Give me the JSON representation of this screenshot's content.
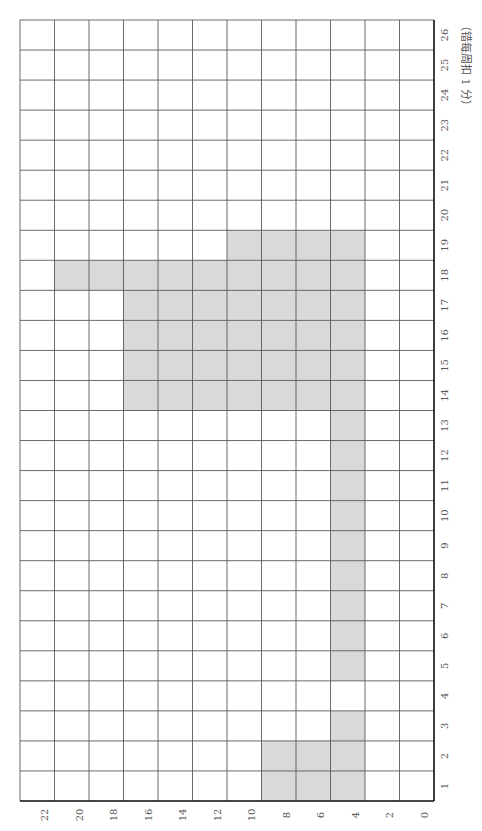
{
  "chart_data": {
    "type": "bar",
    "orientation": "rotated-90",
    "note": "（错每周扣 1 分）",
    "categories": [
      "1",
      "2",
      "3",
      "4",
      "5",
      "6",
      "7",
      "8",
      "9",
      "10",
      "11",
      "12",
      "13",
      "14",
      "15",
      "16",
      "17",
      "18",
      "19",
      "20",
      "21",
      "22",
      "23",
      "24",
      "25",
      "26"
    ],
    "ranges": [
      [
        4,
        10
      ],
      [
        4,
        10
      ],
      [
        4,
        6
      ],
      null,
      [
        4,
        6
      ],
      [
        4,
        6
      ],
      [
        4,
        6
      ],
      [
        4,
        6
      ],
      [
        4,
        6
      ],
      [
        4,
        6
      ],
      [
        4,
        6
      ],
      [
        4,
        6
      ],
      [
        4,
        6
      ],
      [
        4,
        18
      ],
      [
        4,
        18
      ],
      [
        4,
        18
      ],
      [
        4,
        18
      ],
      [
        4,
        22
      ],
      [
        4,
        12
      ],
      null,
      null,
      null,
      null,
      null,
      null,
      null
    ],
    "value_ticks": [
      0,
      2,
      4,
      6,
      8,
      10,
      12,
      14,
      16,
      18,
      20,
      22
    ],
    "value_range": [
      0,
      24
    ],
    "grid": true,
    "xlabel": "",
    "ylabel": "",
    "colors": {
      "fill": "#d9d9d9",
      "grid": "#5a5a5a",
      "axis": "#222222"
    }
  },
  "layout": {
    "grid_left": 20,
    "grid_right": 434,
    "grid_top": 20,
    "grid_bottom": 801,
    "value_step": 2,
    "columns": 12
  }
}
